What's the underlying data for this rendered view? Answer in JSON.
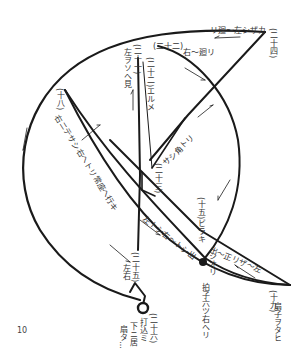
{
  "diagram": {
    "type": "noh-dance-path",
    "page_number": "10",
    "stroke_color": "#1a1a1a",
    "labels": {
      "n14": "(二十四)",
      "n14_text": "リ廻〜左シザカ",
      "n22": "(二十二)",
      "n22_text": "右〜廻リ",
      "n21": "(二十一)",
      "n21_text": "左ヲソへ見",
      "n20": "(二十二)エルメ",
      "n18": "(十八)",
      "n18_text": "右ニテサシ右へトリ常座へ行キ",
      "n23": "(二十三)",
      "n23_text": "サシ角トリ",
      "n15": "(十五)ビラキ",
      "n17": "(十七)",
      "n17_text": "左トシ右〜トシ出",
      "n16": "(十六)",
      "n16_text": "シオリ",
      "n16_caption": "拍子六ツ右へリ",
      "n19_mark": "(二十)",
      "n19_text": "出〜正リザ〜左",
      "n19": "(十九)",
      "n19_caption": "扇子ヲタヒ",
      "n25": "(二十五)",
      "n25_text": "左右",
      "n26": "(二十六)",
      "n26_text_1": "打込ミ",
      "n26_text_2": "下ニ居",
      "n26_text_3": "扇タ…"
    }
  }
}
